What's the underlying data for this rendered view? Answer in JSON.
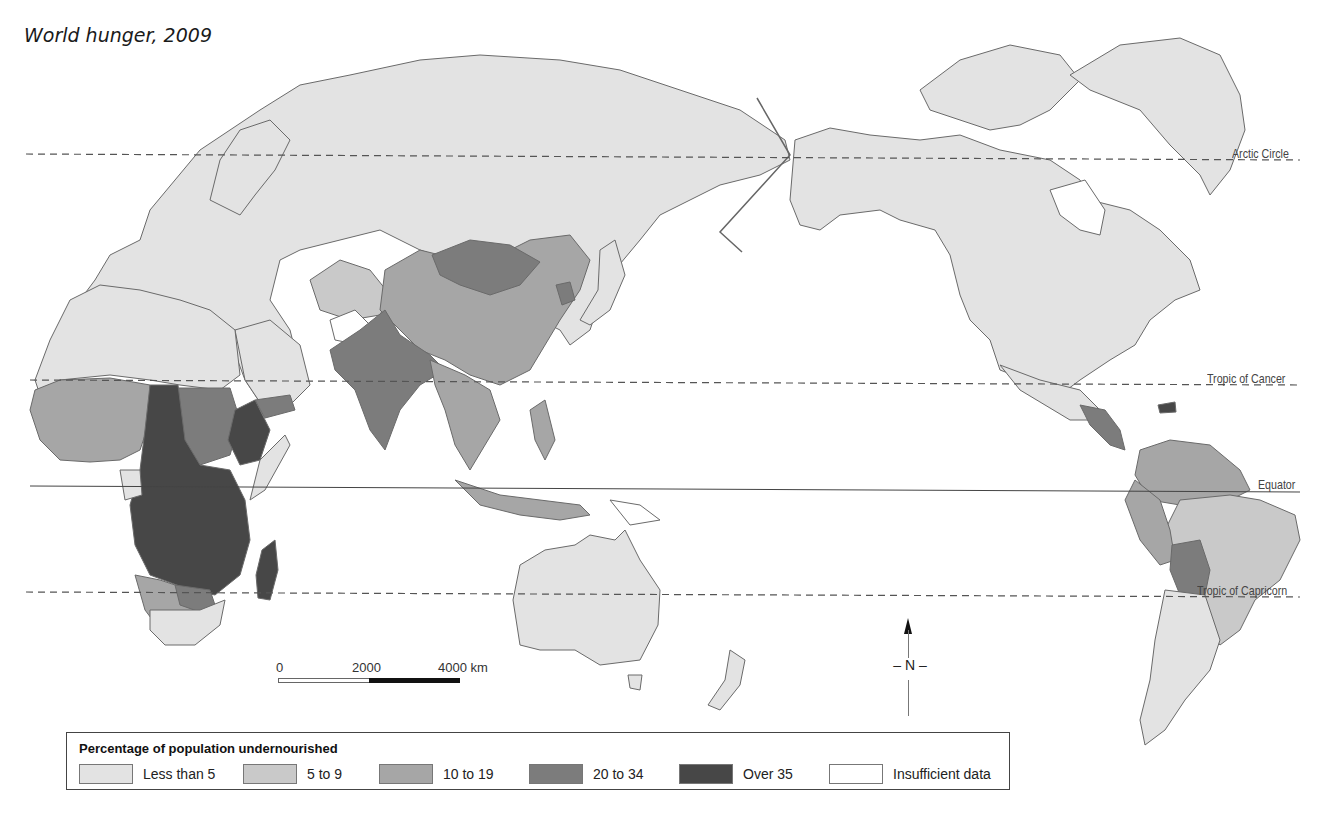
{
  "title": "World hunger, 2009",
  "lines": {
    "arctic_circle": "Arctic Circle",
    "tropic_of_cancer": "Tropic of Cancer",
    "equator": "Equator",
    "tropic_of_capricorn": "Tropic of Capricorn"
  },
  "scale": {
    "ticks": [
      "0",
      "2000",
      "4000 km"
    ]
  },
  "north_label": "N",
  "legend": {
    "title": "Percentage of population undernourished",
    "items": [
      {
        "label": "Less than 5",
        "color": "#e3e3e3"
      },
      {
        "label": "5 to 9",
        "color": "#c9c9c9"
      },
      {
        "label": "10 to 19",
        "color": "#a6a6a6"
      },
      {
        "label": "20 to 34",
        "color": "#7c7c7c"
      },
      {
        "label": "Over 35",
        "color": "#474747"
      },
      {
        "label": "Insufficient data",
        "color": "#ffffff"
      }
    ]
  },
  "colors": {
    "lt5": "#e3e3e3",
    "c5_9": "#c9c9c9",
    "c10_19": "#a6a6a6",
    "c20_34": "#7c7c7c",
    "over35": "#474747",
    "nodata": "#ffffff",
    "border": "#6a6a6a"
  }
}
